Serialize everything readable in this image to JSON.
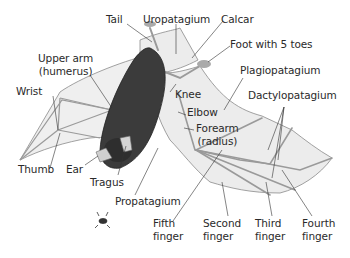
{
  "diagram": {
    "colors": {
      "membrane": "#ececec",
      "membrane_stroke": "#8a8a8a",
      "body": "#3a3a3a",
      "bone": "#d8d8d8",
      "leader_line": "#333333",
      "text": "#2a2a2a"
    },
    "labels": {
      "tail": "Tail",
      "uropatagium": "Uropatagium",
      "calcar": "Calcar",
      "foot": "Foot with 5 toes",
      "upper_arm_1": "Upper arm",
      "upper_arm_2": "(humerus)",
      "plagiopatagium": "Plagiopatagium",
      "wrist": "Wrist",
      "knee": "Knee",
      "dactylopatagium": "Dactylopatagium",
      "elbow": "Elbow",
      "forearm_1": "Forearm",
      "forearm_2": "(radius)",
      "thumb": "Thumb",
      "ear": "Ear",
      "tragus": "Tragus",
      "propatagium": "Propatagium",
      "fifth_finger_1": "Fifth",
      "fifth_finger_2": "finger",
      "second_finger_1": "Second",
      "second_finger_2": "finger",
      "third_finger_1": "Third",
      "third_finger_2": "finger",
      "fourth_finger_1": "Fourth",
      "fourth_finger_2": "finger"
    }
  }
}
